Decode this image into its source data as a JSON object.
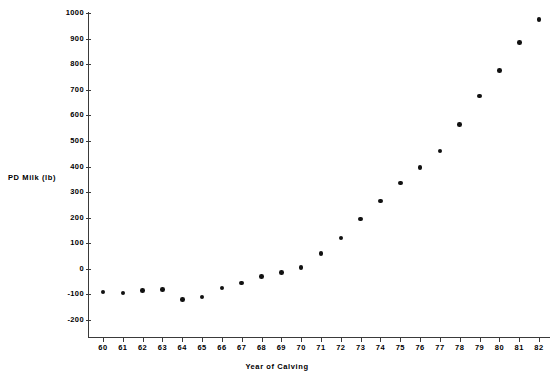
{
  "chart_data": {
    "type": "scatter",
    "title": "",
    "subtitle": "",
    "xlabel": "Year of Calving",
    "ylabel": "PD Milk (lb)",
    "xlim": [
      59,
      83
    ],
    "ylim": [
      -200,
      1000
    ],
    "grid": false,
    "legend": null,
    "marker": "filled-circle",
    "marker_color": "#111111",
    "x_tick_labels": [
      "60",
      "61",
      "62",
      "63",
      "64",
      "65",
      "66",
      "67",
      "68",
      "69",
      "70",
      "71",
      "72",
      "73",
      "74",
      "75",
      "76",
      "77",
      "78",
      "79",
      "80",
      "81",
      "82"
    ],
    "y_tick_labels": [
      "1000",
      "900",
      "800",
      "700",
      "600",
      "500",
      "400",
      "300",
      "200",
      "100",
      "0",
      "-100",
      "-200"
    ],
    "y_ticks": [
      1000,
      900,
      800,
      700,
      600,
      500,
      400,
      300,
      200,
      100,
      0,
      -100,
      -200
    ],
    "x": [
      60,
      61,
      62,
      63,
      64,
      65,
      66,
      67,
      68,
      69,
      70,
      71,
      72,
      73,
      74,
      75,
      76,
      77,
      78,
      79,
      80,
      81,
      82
    ],
    "values": [
      -90,
      -95,
      -85,
      -80,
      -120,
      -110,
      -75,
      -55,
      -30,
      -15,
      5,
      60,
      120,
      195,
      265,
      335,
      395,
      460,
      565,
      675,
      775,
      885,
      975
    ],
    "points": [
      {
        "x": 60,
        "y": -90
      },
      {
        "x": 61,
        "y": -95
      },
      {
        "x": 62,
        "y": -85
      },
      {
        "x": 63,
        "y": -80
      },
      {
        "x": 64,
        "y": -120
      },
      {
        "x": 65,
        "y": -110
      },
      {
        "x": 66,
        "y": -75
      },
      {
        "x": 67,
        "y": -55
      },
      {
        "x": 68,
        "y": -30
      },
      {
        "x": 69,
        "y": -15
      },
      {
        "x": 70,
        "y": 5
      },
      {
        "x": 71,
        "y": 60
      },
      {
        "x": 72,
        "y": 120
      },
      {
        "x": 73,
        "y": 195
      },
      {
        "x": 74,
        "y": 265
      },
      {
        "x": 75,
        "y": 335
      },
      {
        "x": 76,
        "y": 395
      },
      {
        "x": 77,
        "y": 460
      },
      {
        "x": 78,
        "y": 565
      },
      {
        "x": 79,
        "y": 675
      },
      {
        "x": 80,
        "y": 775
      },
      {
        "x": 81,
        "y": 885
      },
      {
        "x": 82,
        "y": 975
      }
    ]
  },
  "colors": {
    "axis": "#3a3a3a",
    "marker": "#111111",
    "background": "#ffffff",
    "text": "#000000"
  },
  "geometry": {
    "x_axis_left_px": 88,
    "x_axis_right_px": 550,
    "x_axis_y_px": 337,
    "y_axis_top_px": 12,
    "y_value_1000_px": 13,
    "y_value_neg200_px": 320,
    "first_tick_x_px": 103,
    "tick_spacing_px": 19.82
  }
}
